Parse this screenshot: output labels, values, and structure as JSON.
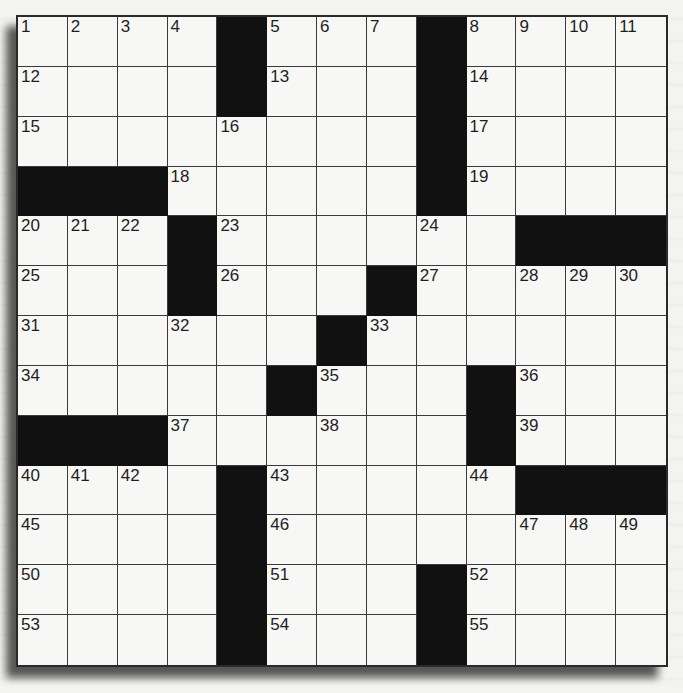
{
  "puzzle": {
    "rows": 13,
    "cols": 13,
    "colors": {
      "background": "#f3f3f1",
      "cell": "#f7f7f5",
      "block": "#111111",
      "gridline": "#3a3a3a",
      "number": "#1e1e1e"
    },
    "grid": [
      [
        "1",
        "2",
        "3",
        "4",
        "#",
        "5",
        "6",
        "7",
        "#",
        "8",
        "9",
        "10",
        "11"
      ],
      [
        "12",
        "",
        "",
        "",
        "#",
        "13",
        "",
        "",
        "#",
        "14",
        "",
        "",
        ""
      ],
      [
        "15",
        "",
        "",
        "",
        "16",
        "",
        "",
        "",
        "#",
        "17",
        "",
        "",
        ""
      ],
      [
        "#",
        "#",
        "#",
        "18",
        "",
        "",
        "",
        "",
        "#",
        "19",
        "",
        "",
        ""
      ],
      [
        "20",
        "21",
        "22",
        "#",
        "23",
        "",
        "",
        "",
        "24",
        "",
        "#",
        "#",
        "#"
      ],
      [
        "25",
        "",
        "",
        "#",
        "26",
        "",
        "",
        "#",
        "27",
        "",
        "28",
        "29",
        "30"
      ],
      [
        "31",
        "",
        "",
        "32",
        "",
        "",
        "#",
        "33",
        "",
        "",
        "",
        "",
        ""
      ],
      [
        "34",
        "",
        "",
        "",
        "",
        "#",
        "35",
        "",
        "",
        "#",
        "36",
        "",
        ""
      ],
      [
        "#",
        "#",
        "#",
        "37",
        "",
        "",
        "38",
        "",
        "",
        "#",
        "39",
        "",
        ""
      ],
      [
        "40",
        "41",
        "42",
        "",
        "#",
        "43",
        "",
        "",
        "",
        "44",
        "#",
        "#",
        "#"
      ],
      [
        "45",
        "",
        "",
        "",
        "#",
        "46",
        "",
        "",
        "",
        "",
        "47",
        "48",
        "49"
      ],
      [
        "50",
        "",
        "",
        "",
        "#",
        "51",
        "",
        "",
        "#",
        "52",
        "",
        "",
        ""
      ],
      [
        "53",
        "",
        "",
        "",
        "#",
        "54",
        "",
        "",
        "#",
        "55",
        "",
        "",
        ""
      ]
    ],
    "entries": []
  }
}
